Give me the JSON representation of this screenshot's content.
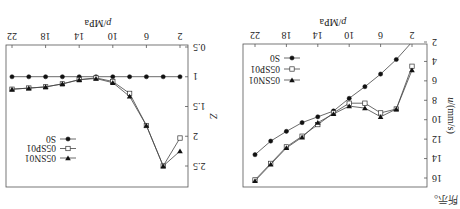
{
  "page": {
    "rotation_deg": 180,
    "caption_fragment": "所示。"
  },
  "chart_data": [
    {
      "type": "line",
      "title": "",
      "xlabel_var": "p",
      "xlabel_unit": "/MPa",
      "ylabel_var": "u",
      "ylabel_unit": "/(mm/s)",
      "xlim": [
        2,
        22
      ],
      "ylim": [
        2,
        16
      ],
      "xticks": [
        2,
        6,
        10,
        14,
        18,
        22
      ],
      "yticks": [
        2,
        4,
        6,
        8,
        10,
        12,
        14,
        16
      ],
      "grid": false,
      "legend_position": "lower right",
      "x": [
        2,
        4,
        6,
        8,
        10,
        12,
        14,
        16,
        18,
        20,
        22
      ],
      "series": [
        {
          "name": "S0",
          "marker": "filled-circle",
          "values": [
            2.0,
            3.8,
            5.3,
            6.6,
            7.8,
            9.1,
            9.7,
            10.3,
            11.2,
            12.2,
            13.6
          ]
        },
        {
          "name": "05SP01",
          "marker": "open-square",
          "values": [
            4.5,
            8.9,
            9.3,
            8.3,
            8.3,
            9.3,
            10.5,
            11.7,
            12.8,
            14.5,
            16.2
          ]
        },
        {
          "name": "05SN01",
          "marker": "filled-triangle-down",
          "values": [
            4.9,
            8.9,
            9.7,
            8.8,
            8.6,
            9.4,
            10.3,
            11.8,
            12.9,
            14.6,
            16.3
          ]
        }
      ]
    },
    {
      "type": "line",
      "title": "",
      "xlabel_var": "p",
      "xlabel_unit": "/MPa",
      "ylabel_var": "Z",
      "ylabel_unit": "",
      "xlim": [
        2,
        22
      ],
      "ylim": [
        0.5,
        2.5
      ],
      "xticks": [
        2,
        6,
        10,
        14,
        18,
        22
      ],
      "yticks": [
        0.5,
        1,
        1.5,
        2,
        2.5
      ],
      "grid": false,
      "legend_position": "upper right",
      "x": [
        2,
        4,
        6,
        8,
        10,
        12,
        14,
        16,
        18,
        20,
        22
      ],
      "series": [
        {
          "name": "S0",
          "marker": "filled-circle",
          "values": [
            1.0,
            1.0,
            1.0,
            1.0,
            1.0,
            1.0,
            1.0,
            1.0,
            1.0,
            1.0,
            1.0
          ]
        },
        {
          "name": "05SP01",
          "marker": "open-square",
          "values": [
            2.03,
            2.5,
            1.82,
            1.28,
            1.08,
            1.02,
            1.05,
            1.12,
            1.17,
            1.19,
            1.21
          ]
        },
        {
          "name": "05SN01",
          "marker": "filled-triangle-down",
          "values": [
            2.25,
            2.5,
            1.82,
            1.33,
            1.1,
            1.03,
            1.05,
            1.12,
            1.17,
            1.19,
            1.21
          ]
        }
      ]
    }
  ]
}
